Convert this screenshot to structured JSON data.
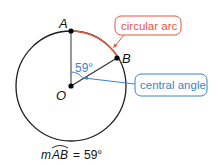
{
  "diagram": {
    "type": "geometry-circle-arc",
    "points": {
      "A": {
        "label": "A"
      },
      "B": {
        "label": "B"
      },
      "O": {
        "label": "O"
      }
    },
    "angle_label": "59°",
    "callouts": {
      "arc": {
        "label": "circular arc",
        "color": "#e8553f"
      },
      "angle": {
        "label": "central angle",
        "color": "#3d84c6"
      }
    },
    "measure": {
      "prefix": "m",
      "arc": "AB",
      "equals": "=",
      "value": "59°"
    },
    "colors": {
      "circle": "#222222",
      "arc": "#e8553f",
      "angle": "#3d84c6",
      "radius": "#333333"
    }
  }
}
